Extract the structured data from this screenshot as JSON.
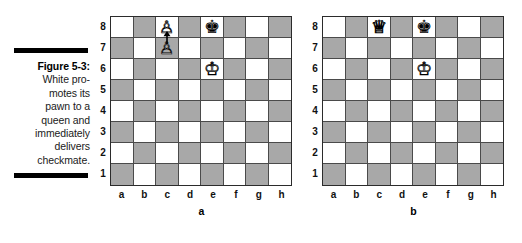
{
  "figure": {
    "label": "Figure 5-3:",
    "caption_lines": [
      "White pro-",
      "motes its",
      "pawn to a",
      "queen and",
      "immediately",
      "delivers",
      "checkmate."
    ],
    "caption_full": "Figure 5-3: White promotes its pawn to a queen and immediately delivers checkmate."
  },
  "colors": {
    "light_square": "#ffffff",
    "dark_square": "#a8a8a8",
    "board_border": "#2b2b2b",
    "grid_line": "#4a4a4a",
    "rule": "#000000",
    "text": "#000000"
  },
  "glyphs": {
    "white_king": "♔",
    "white_queen": "♕",
    "white_pawn": "♙",
    "black_king": "♚",
    "black_queen": "♛",
    "black_pawn": "♟"
  },
  "files": [
    "a",
    "b",
    "c",
    "d",
    "e",
    "f",
    "g",
    "h"
  ],
  "ranks": [
    "8",
    "7",
    "6",
    "5",
    "4",
    "3",
    "2",
    "1"
  ],
  "boards": [
    {
      "id": "a",
      "caption": "a",
      "description": "Position before promotion: white pawn on c7 advancing to c8",
      "pieces": [
        {
          "square": "c8",
          "file": "c",
          "rank": "8",
          "piece": "white-pawn-promoting",
          "color": "white",
          "type": "pawn",
          "glyph": "♙"
        },
        {
          "square": "e8",
          "file": "e",
          "rank": "8",
          "piece": "black-king",
          "color": "black",
          "type": "king",
          "glyph": "♚"
        },
        {
          "square": "c7",
          "file": "c",
          "rank": "7",
          "piece": "white-pawn",
          "color": "white",
          "type": "pawn",
          "glyph": "♙"
        },
        {
          "square": "e6",
          "file": "e",
          "rank": "6",
          "piece": "white-king",
          "color": "white",
          "type": "king",
          "glyph": "♔"
        }
      ],
      "arrow": {
        "from": "c7",
        "to": "c8",
        "direction": "up"
      }
    },
    {
      "id": "b",
      "caption": "b",
      "description": "Position after promotion: white queen on c8 delivering checkmate",
      "pieces": [
        {
          "square": "c8",
          "file": "c",
          "rank": "8",
          "piece": "white-queen",
          "color": "white",
          "type": "queen",
          "glyph": "♕"
        },
        {
          "square": "e8",
          "file": "e",
          "rank": "8",
          "piece": "black-king",
          "color": "black",
          "type": "king",
          "glyph": "♚"
        },
        {
          "square": "e6",
          "file": "e",
          "rank": "6",
          "piece": "white-king",
          "color": "white",
          "type": "king",
          "glyph": "♔"
        }
      ],
      "arrow": null
    }
  ]
}
